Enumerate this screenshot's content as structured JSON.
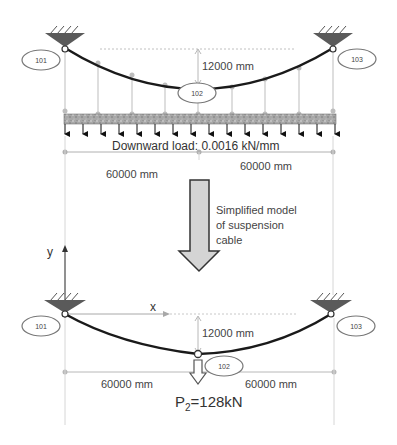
{
  "top_model": {
    "nodes": [
      {
        "id": "101",
        "label": "101"
      },
      {
        "id": "102",
        "label": "102"
      },
      {
        "id": "103",
        "label": "103"
      }
    ],
    "sag_label": "12000 mm",
    "load_label": "Downward load: 0.0016 kN/mm",
    "span_left_label": "60000 mm",
    "span_right_label": "60000 mm"
  },
  "transition": {
    "label_line1": "Simplified model",
    "label_line2": "of suspension",
    "label_line3": "cable"
  },
  "bottom_model": {
    "axis_y": "y",
    "axis_x": "x",
    "nodes": [
      {
        "id": "101",
        "label": "101"
      },
      {
        "id": "102",
        "label": "102"
      },
      {
        "id": "103",
        "label": "103"
      }
    ],
    "sag_label": "12000 mm",
    "span_left_label": "60000 mm",
    "span_right_label": "60000 mm",
    "force_label_prefix": "P",
    "force_label_sub": "2",
    "force_label_suffix": "=128kN"
  },
  "colors": {
    "cable": "#1a1a1a",
    "support": "#5a5a5a",
    "hanger": "#c8c8c8",
    "deck": "#9a9a9a",
    "dim_line": "#b0b0b0",
    "arrow_fill": "#d4d4d4"
  }
}
